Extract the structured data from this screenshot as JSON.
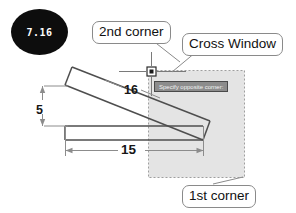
{
  "figure": {
    "badge_label": "7.16",
    "badge_color": "#0d0d0d",
    "badge_text_color": "#ffffff"
  },
  "callouts": [
    {
      "key": "second_corner",
      "label": "2nd corner"
    },
    {
      "key": "cross_window",
      "label": "Cross Window"
    },
    {
      "key": "first_corner",
      "label": "1st corner"
    }
  ],
  "callout_map": {
    "second_corner": "2nd corner",
    "cross_window": "Cross Window",
    "first_corner": "1st corner"
  },
  "cad": {
    "tooltip_text": "Specify opposite corner:",
    "tooltip_bg": "#8c8c8c",
    "tooltip_text_color": "#f2f2f2",
    "selection_fill": "#e3e3e3",
    "selection_border": "#9a9a9a",
    "crosshair_color": "#6f6f6f",
    "geometry_color": "#4a4a4a",
    "dimension_color": "#7a7a7a"
  },
  "dimensions": [
    {
      "key": "length_upper",
      "label": "16",
      "orientation": "inclined"
    },
    {
      "key": "height_left",
      "label": "5",
      "orientation": "vertical"
    },
    {
      "key": "length_base",
      "label": "15",
      "orientation": "horizontal"
    }
  ],
  "dimension_map": {
    "length_upper": "16",
    "height_left": "5",
    "length_base": "15"
  },
  "icons": {
    "pickbox": "pickbox-icon",
    "crosshair": "crosshair-icon"
  }
}
